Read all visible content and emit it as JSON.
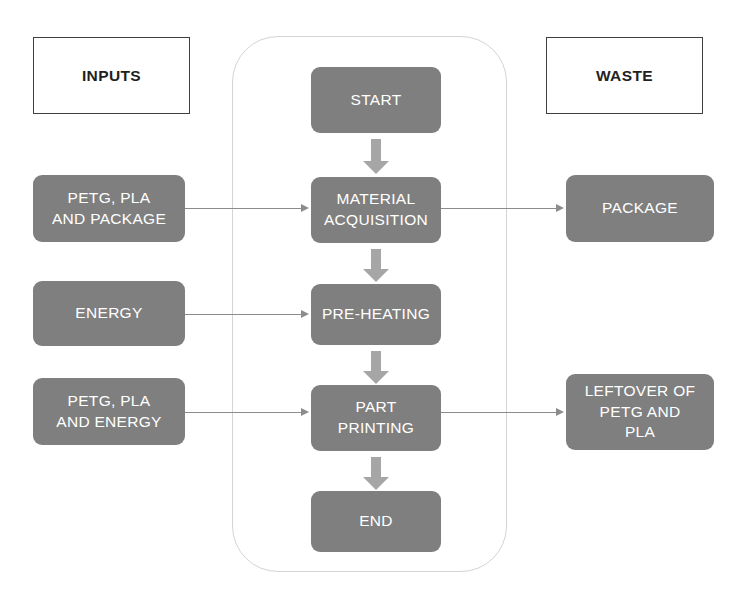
{
  "diagram": {
    "colors": {
      "node_fill": "#7f7f7f",
      "node_text": "#ffffff",
      "arrow_block": "#a6a6a6",
      "connector_line": "#8c8c8c",
      "container_border": "#d4d4d4",
      "legend_border": "#3f3f3f",
      "background": "#ffffff"
    }
  },
  "legend": {
    "inputs_label": "INPUTS",
    "waste_label": "WASTE"
  },
  "process": {
    "nodes": [
      {
        "id": "start",
        "lines": [
          "START"
        ]
      },
      {
        "id": "material-acquisition",
        "lines": [
          "MATERIAL",
          "ACQUISITION"
        ]
      },
      {
        "id": "pre-heating",
        "lines": [
          "PRE-HEATING"
        ]
      },
      {
        "id": "part-printing",
        "lines": [
          "PART",
          "PRINTING"
        ]
      },
      {
        "id": "end",
        "lines": [
          "END"
        ]
      }
    ]
  },
  "inputs": {
    "nodes": [
      {
        "id": "petg-pla-and-package",
        "lines": [
          "PETG, PLA",
          "AND PACKAGE"
        ]
      },
      {
        "id": "energy",
        "lines": [
          "ENERGY"
        ]
      },
      {
        "id": "petg-pla-and-energy",
        "lines": [
          "PETG, PLA",
          "AND ENERGY"
        ]
      }
    ]
  },
  "waste": {
    "nodes": [
      {
        "id": "package",
        "lines": [
          "PACKAGE"
        ]
      },
      {
        "id": "leftover-of-petg-and-pla",
        "lines": [
          "LEFTOVER OF",
          "PETG AND",
          "PLA"
        ]
      }
    ]
  },
  "connections": [
    {
      "from": "petg-pla-and-package",
      "to": "material-acquisition"
    },
    {
      "from": "energy",
      "to": "pre-heating"
    },
    {
      "from": "petg-pla-and-energy",
      "to": "part-printing"
    },
    {
      "from": "material-acquisition",
      "to": "package"
    },
    {
      "from": "part-printing",
      "to": "leftover-of-petg-and-pla"
    },
    {
      "from": "start",
      "to": "material-acquisition"
    },
    {
      "from": "material-acquisition",
      "to": "pre-heating"
    },
    {
      "from": "pre-heating",
      "to": "part-printing"
    },
    {
      "from": "part-printing",
      "to": "end"
    }
  ]
}
